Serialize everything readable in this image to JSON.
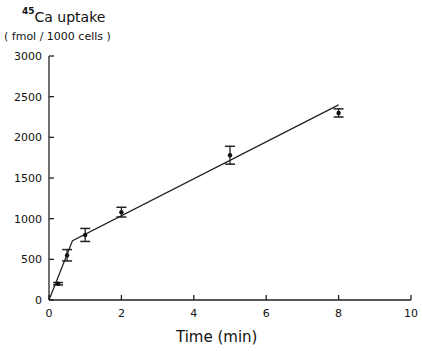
{
  "chart_data": {
    "type": "line",
    "title": "",
    "ylabel_isotope": "45",
    "ylabel_main": "Ca uptake",
    "ylabel_units": "( fmol / 1000 cells )",
    "xlabel": "Time (min)",
    "xlim": [
      0,
      10
    ],
    "ylim": [
      0,
      3000
    ],
    "xticks": [
      0,
      2,
      4,
      6,
      8,
      10
    ],
    "yticks": [
      0,
      500,
      1000,
      1500,
      2000,
      2500,
      3000
    ],
    "grid": false,
    "legend": null,
    "series": [
      {
        "name": "measured",
        "style": "points with error bars",
        "x": [
          0.25,
          0.5,
          1,
          2,
          5,
          8
        ],
        "y": [
          200,
          550,
          800,
          1080,
          1780,
          2300
        ],
        "err": [
          15,
          70,
          80,
          60,
          110,
          50
        ]
      },
      {
        "name": "fit",
        "style": "line",
        "x": [
          0,
          0.65,
          8
        ],
        "y": [
          0,
          730,
          2400
        ]
      }
    ]
  }
}
